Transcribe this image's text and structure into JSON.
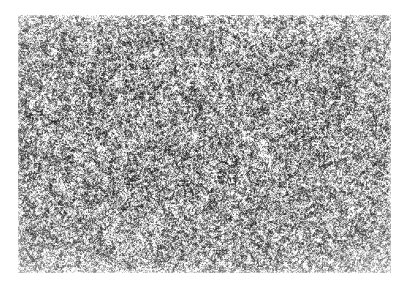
{
  "page": {
    "background_color": "#ffffff",
    "width": 409,
    "height": 285
  },
  "figure": {
    "kind": "micrograph",
    "caption": "",
    "label": "",
    "scale_bar_text": "",
    "magnification_text": ""
  },
  "micrograph": {
    "left": 18,
    "top": 15,
    "width": 373,
    "height": 258,
    "mean_gray": "#9a9a9a",
    "dark_gray": "#2b2b2b",
    "light_gray": "#f2f2f2",
    "grain_scale_px": 2,
    "contrast": 1.55,
    "brightness": 0.02,
    "seed": 20240517
  },
  "chart_data": {
    "type": "heatmap",
    "title": "",
    "xlabel": "",
    "ylabel": "",
    "colormap": "gray",
    "vmin": 0,
    "vmax": 255,
    "note": "Random fine-grained speckle field representing an etched metallographic microstructure"
  }
}
